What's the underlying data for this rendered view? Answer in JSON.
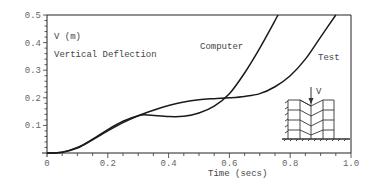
{
  "chart_data": {
    "type": "line",
    "title": "",
    "xlabel": "Time (secs)",
    "ylabel": "V (m)",
    "annotation": "Vertical Deflection",
    "xlim": [
      0,
      1.0
    ],
    "ylim": [
      0,
      0.5
    ],
    "x_ticks": [
      "0",
      "0.2",
      "0.4",
      "0.6",
      "0.8",
      "1.0"
    ],
    "y_ticks": [
      "0.1",
      "0.2",
      "0.3",
      "0.4",
      "0.5"
    ],
    "grid": false,
    "legend": "inline labels",
    "series": [
      {
        "name": "Computer",
        "x": [
          0,
          0.05,
          0.1,
          0.15,
          0.2,
          0.25,
          0.3,
          0.33,
          0.4,
          0.45,
          0.5,
          0.55,
          0.6,
          0.65,
          0.7,
          0.76
        ],
        "y": [
          0,
          0.003,
          0.02,
          0.05,
          0.085,
          0.115,
          0.135,
          0.138,
          0.132,
          0.133,
          0.145,
          0.17,
          0.215,
          0.29,
          0.38,
          0.5
        ]
      },
      {
        "name": "Test",
        "x": [
          0,
          0.05,
          0.1,
          0.15,
          0.2,
          0.25,
          0.3,
          0.35,
          0.4,
          0.45,
          0.5,
          0.55,
          0.6,
          0.65,
          0.7,
          0.75,
          0.8,
          0.85,
          0.9,
          0.95
        ],
        "y": [
          0,
          0.003,
          0.018,
          0.048,
          0.08,
          0.11,
          0.135,
          0.155,
          0.172,
          0.185,
          0.193,
          0.197,
          0.2,
          0.205,
          0.215,
          0.24,
          0.28,
          0.34,
          0.42,
          0.5
        ]
      }
    ],
    "inset": {
      "description": "Frame structure diagram with downward vertical load",
      "load_label": "V"
    }
  },
  "labels": {
    "ylabel_units": "V (m)",
    "annotation": "Vertical Deflection",
    "series_computer": "Computer",
    "series_test": "Test",
    "xlabel": "Time (secs)",
    "inset_load": "V"
  }
}
